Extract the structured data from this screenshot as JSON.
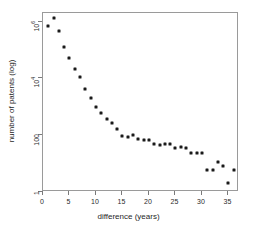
{
  "chart_data": {
    "type": "scatter",
    "title": "",
    "xlabel": "difference (years)",
    "ylabel": "number of patents (log)",
    "yscale": "log",
    "xlim": [
      0,
      37
    ],
    "ylim": [
      1,
      2000000
    ],
    "grid": false,
    "legend": null,
    "xticks": [
      "0",
      "5",
      "10",
      "15",
      "20",
      "25",
      "30",
      "35"
    ],
    "xtick_values": [
      0,
      5,
      10,
      15,
      20,
      25,
      30,
      35
    ],
    "yticks": [
      "1",
      "100",
      "10^4",
      "10^6"
    ],
    "ytick_values": [
      1,
      100,
      10000,
      1000000
    ],
    "ytick_labels": [
      {
        "base": "1",
        "exp": ""
      },
      {
        "base": "100",
        "exp": ""
      },
      {
        "base": "10",
        "exp": "4"
      },
      {
        "base": "10",
        "exp": "6"
      }
    ],
    "marker": "filled-square",
    "marker_color": "#1a1a1a",
    "x": [
      1,
      2,
      3,
      4,
      5,
      6,
      7,
      8,
      9,
      10,
      11,
      12,
      13,
      14,
      15,
      16,
      17,
      18,
      19,
      20,
      21,
      22,
      23,
      24,
      25,
      26,
      27,
      28,
      29,
      30,
      31,
      32,
      33,
      34,
      35,
      36
    ],
    "values": [
      700000,
      1300000,
      450000,
      130000,
      52000,
      21000,
      11000,
      4200,
      2000,
      1000,
      600,
      380,
      260,
      170,
      95,
      86,
      105,
      72,
      70,
      70,
      48,
      46,
      50,
      48,
      36,
      38,
      34,
      24,
      24,
      24,
      6,
      6,
      11,
      8,
      2,
      6
    ],
    "series": [
      {
        "name": "patents",
        "x": [
          1,
          2,
          3,
          4,
          5,
          6,
          7,
          8,
          9,
          10,
          11,
          12,
          13,
          14,
          15,
          16,
          17,
          18,
          19,
          20,
          21,
          22,
          23,
          24,
          25,
          26,
          27,
          28,
          29,
          30,
          31,
          32,
          33,
          34,
          35,
          36
        ],
        "values": [
          700000,
          1300000,
          450000,
          130000,
          52000,
          21000,
          11000,
          4200,
          2000,
          1000,
          600,
          380,
          260,
          170,
          95,
          86,
          105,
          72,
          70,
          70,
          48,
          46,
          50,
          48,
          36,
          38,
          34,
          24,
          24,
          24,
          6,
          6,
          11,
          8,
          2,
          6
        ]
      }
    ]
  }
}
